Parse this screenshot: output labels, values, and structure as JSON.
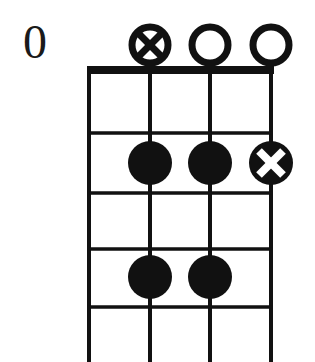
{
  "diagram": {
    "kind": "guitar-chord-diagram",
    "fret_position_label": "0",
    "string_count": 4,
    "fret_count": 5,
    "colors": {
      "ink": "#111111",
      "paper": "#ffffff",
      "dot_fill": "#111111",
      "marker_stroke": "#111111",
      "x_mark": "#ffffff"
    },
    "geometry": {
      "grid_left": 89,
      "grid_right": 272,
      "nut_top": 68,
      "nut_thickness": 7,
      "string_x": [
        89,
        150,
        210,
        271
      ],
      "fret_y": [
        74,
        133,
        193,
        249,
        307
      ],
      "grid_bottom": 362,
      "dot_radius": 22,
      "marker_radius": 21,
      "marker_y": 45
    },
    "open_markers": [
      {
        "label": "x-in-circle",
        "string": 2,
        "x": 150,
        "y": 45,
        "type": "circle-x"
      },
      {
        "label": "open",
        "string": 3,
        "x": 210,
        "y": 45,
        "type": "circle-open"
      },
      {
        "label": "open",
        "string": 4,
        "x": 271,
        "y": 45,
        "type": "circle-open"
      }
    ],
    "finger_dots": [
      {
        "label": "dot-fret2-string2",
        "string": 2,
        "fret": 2,
        "x": 150,
        "y": 163,
        "type": "filled"
      },
      {
        "label": "dot-fret2-string3",
        "string": 3,
        "fret": 2,
        "x": 210,
        "y": 163,
        "type": "filled"
      },
      {
        "label": "dot-fret2-string4",
        "string": 4,
        "fret": 2,
        "x": 271,
        "y": 163,
        "type": "filled-x"
      },
      {
        "label": "dot-fret4-string2",
        "string": 2,
        "fret": 4,
        "x": 150,
        "y": 277,
        "type": "filled"
      },
      {
        "label": "dot-fret4-string3",
        "string": 3,
        "fret": 4,
        "x": 210,
        "y": 277,
        "type": "filled"
      }
    ]
  }
}
